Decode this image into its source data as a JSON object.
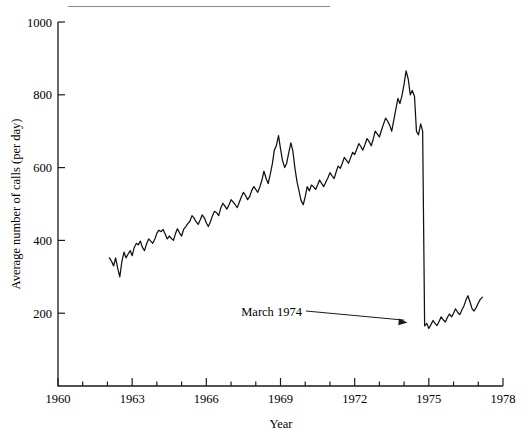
{
  "figure": {
    "top_rule": true
  },
  "chart_data": {
    "type": "line",
    "title": "",
    "xlabel": "Year",
    "ylabel": "Average number of calls (per day)",
    "xlim": [
      1960,
      1978
    ],
    "ylim": [
      0,
      1000
    ],
    "xticks": [
      1960,
      1963,
      1966,
      1969,
      1972,
      1975,
      1978
    ],
    "xticklabels": [
      "1960",
      "1963",
      "1966",
      "1969",
      "1972",
      "1975",
      "1978"
    ],
    "xminorticks": [
      1961,
      1962,
      1964,
      1965,
      1967,
      1968,
      1970,
      1971,
      1973,
      1974,
      1976,
      1977
    ],
    "yticks": [
      200,
      400,
      600,
      800,
      1000
    ],
    "yticklabels": [
      "200",
      "400",
      "600",
      "800",
      "1000"
    ],
    "grid": false,
    "legend": null,
    "annotations": [
      {
        "text": "March 1974",
        "x": 1974.2,
        "y": 170,
        "label_x": 1969.4,
        "label_y": 245
      }
    ],
    "series": [
      {
        "name": "Average number of calls (per day)",
        "x": [
          1962.08,
          1962.17,
          1962.25,
          1962.33,
          1962.42,
          1962.5,
          1962.58,
          1962.67,
          1962.75,
          1962.83,
          1962.92,
          1963.0,
          1963.08,
          1963.17,
          1963.25,
          1963.33,
          1963.42,
          1963.5,
          1963.58,
          1963.67,
          1963.75,
          1963.83,
          1963.92,
          1964.0,
          1964.08,
          1964.17,
          1964.25,
          1964.33,
          1964.42,
          1964.5,
          1964.58,
          1964.67,
          1964.75,
          1964.83,
          1964.92,
          1965.0,
          1965.08,
          1965.17,
          1965.25,
          1965.33,
          1965.42,
          1965.5,
          1965.58,
          1965.67,
          1965.75,
          1965.83,
          1965.92,
          1966.0,
          1966.08,
          1966.17,
          1966.25,
          1966.33,
          1966.42,
          1966.5,
          1966.58,
          1966.67,
          1966.75,
          1966.83,
          1966.92,
          1967.0,
          1967.08,
          1967.17,
          1967.25,
          1967.33,
          1967.42,
          1967.5,
          1967.58,
          1967.67,
          1967.75,
          1967.83,
          1967.92,
          1968.0,
          1968.08,
          1968.17,
          1968.25,
          1968.33,
          1968.42,
          1968.5,
          1968.58,
          1968.67,
          1968.75,
          1968.83,
          1968.92,
          1969.0,
          1969.08,
          1969.17,
          1969.25,
          1969.33,
          1969.42,
          1969.5,
          1969.58,
          1969.67,
          1969.75,
          1969.83,
          1969.92,
          1970.0,
          1970.08,
          1970.17,
          1970.25,
          1970.33,
          1970.42,
          1970.5,
          1970.58,
          1970.67,
          1970.75,
          1970.83,
          1970.92,
          1971.0,
          1971.08,
          1971.17,
          1971.25,
          1971.33,
          1971.42,
          1971.5,
          1971.58,
          1971.67,
          1971.75,
          1971.83,
          1971.92,
          1972.0,
          1972.08,
          1972.17,
          1972.25,
          1972.33,
          1972.42,
          1972.5,
          1972.58,
          1972.67,
          1972.75,
          1972.83,
          1972.92,
          1973.0,
          1973.08,
          1973.17,
          1973.25,
          1973.33,
          1973.42,
          1973.5,
          1973.58,
          1973.67,
          1973.75,
          1973.83,
          1973.92,
          1974.0,
          1974.08,
          1974.17,
          1974.25,
          1974.33,
          1974.42,
          1974.5,
          1974.58,
          1974.67,
          1974.75,
          1974.83,
          1974.92,
          1975.0,
          1975.08,
          1975.17,
          1975.25,
          1975.33,
          1975.42,
          1975.5,
          1975.58,
          1975.67,
          1975.75,
          1975.83,
          1975.92,
          1976.0,
          1976.08,
          1976.17,
          1976.25,
          1976.33,
          1976.42,
          1976.5,
          1976.58,
          1976.67,
          1976.75,
          1976.83,
          1976.92,
          1977.0,
          1977.08,
          1977.17
        ],
        "y": [
          352,
          342,
          330,
          352,
          322,
          300,
          340,
          368,
          352,
          362,
          372,
          358,
          380,
          392,
          388,
          398,
          380,
          372,
          390,
          404,
          398,
          392,
          404,
          420,
          428,
          424,
          430,
          418,
          404,
          412,
          406,
          400,
          418,
          432,
          420,
          412,
          430,
          438,
          446,
          452,
          468,
          462,
          452,
          444,
          456,
          470,
          462,
          448,
          438,
          452,
          468,
          480,
          476,
          468,
          488,
          502,
          494,
          486,
          498,
          512,
          506,
          498,
          490,
          504,
          520,
          532,
          524,
          512,
          520,
          536,
          548,
          540,
          532,
          548,
          566,
          590,
          570,
          556,
          580,
          610,
          648,
          660,
          688,
          652,
          620,
          600,
          612,
          640,
          668,
          646,
          600,
          560,
          536,
          510,
          498,
          520,
          548,
          536,
          552,
          548,
          540,
          552,
          566,
          556,
          548,
          560,
          572,
          586,
          578,
          570,
          588,
          604,
          598,
          612,
          628,
          620,
          612,
          626,
          642,
          636,
          650,
          666,
          658,
          648,
          664,
          680,
          672,
          660,
          678,
          700,
          692,
          684,
          702,
          720,
          736,
          728,
          716,
          700,
          730,
          762,
          790,
          776,
          800,
          830,
          866,
          842,
          800,
          812,
          796,
          700,
          690,
          720,
          700,
          165,
          172,
          158,
          168,
          180,
          172,
          166,
          178,
          190,
          182,
          176,
          188,
          198,
          190,
          200,
          212,
          202,
          196,
          208,
          220,
          236,
          248,
          230,
          212,
          206,
          216,
          228,
          238,
          244
        ]
      }
    ]
  },
  "axes": {
    "y_axis_title": "Average number of calls (per day)",
    "x_axis_title": "Year"
  }
}
